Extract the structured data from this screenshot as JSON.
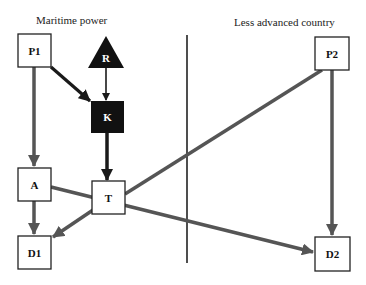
{
  "regions": {
    "left": {
      "label": "Maritime power"
    },
    "right": {
      "label": "Less advanced country"
    }
  },
  "colors": {
    "edge_gray": "#555555",
    "edge_dark": "#1a1a1a",
    "node_fill_dark": "#111111",
    "node_fill_light": "#ffffff",
    "divider": "#222222"
  },
  "nodes": [
    {
      "id": "P1",
      "label": "P1",
      "shape": "box",
      "fill": "light"
    },
    {
      "id": "R",
      "label": "R",
      "shape": "triangle",
      "fill": "dark"
    },
    {
      "id": "K",
      "label": "K",
      "shape": "box",
      "fill": "dark"
    },
    {
      "id": "A",
      "label": "A",
      "shape": "box",
      "fill": "light"
    },
    {
      "id": "T",
      "label": "T",
      "shape": "box",
      "fill": "light"
    },
    {
      "id": "D1",
      "label": "D1",
      "shape": "box",
      "fill": "light"
    },
    {
      "id": "P2",
      "label": "P2",
      "shape": "box",
      "fill": "light"
    },
    {
      "id": "D2",
      "label": "D2",
      "shape": "box",
      "fill": "light"
    }
  ],
  "edges": [
    {
      "from": "P1",
      "to": "K",
      "style": "dark",
      "arrow": true
    },
    {
      "from": "R",
      "to": "K",
      "style": "thin-dark",
      "arrow": true
    },
    {
      "from": "K",
      "to": "T",
      "style": "dark",
      "arrow": true
    },
    {
      "from": "P1",
      "to": "A",
      "style": "gray",
      "arrow": true
    },
    {
      "from": "A",
      "to": "D1",
      "style": "gray",
      "arrow": true
    },
    {
      "from": "T",
      "to": "D1",
      "style": "gray",
      "arrow": true
    },
    {
      "from": "A",
      "to": "D2",
      "style": "gray",
      "arrow": true
    },
    {
      "from": "P2",
      "to": "T",
      "style": "gray",
      "arrow": false
    },
    {
      "from": "P2",
      "to": "D2",
      "style": "gray",
      "arrow": true
    }
  ]
}
